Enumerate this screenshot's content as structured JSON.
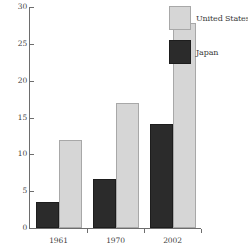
{
  "chart_data": {
    "type": "bar",
    "title": "",
    "subtitle": "",
    "xlabel": "",
    "ylabel": "",
    "categories": [
      "1961",
      "1970",
      "2002"
    ],
    "series": [
      {
        "name": "Japan",
        "color": "#2b2b2b",
        "values": [
          3.5,
          6.7,
          14.1
        ]
      },
      {
        "name": "United States",
        "color": "#d6d6d6",
        "values": [
          12.0,
          17.0,
          27.8
        ]
      }
    ],
    "ylim": [
      0,
      30
    ],
    "ytick_values": [
      0,
      5,
      10,
      15,
      20,
      25,
      30
    ],
    "ytick_labels": [
      "0",
      "5",
      "10",
      "15",
      "20",
      "25",
      "30"
    ],
    "grid": false,
    "legend_position": "top-right",
    "legend": [
      {
        "label": "United States",
        "color": "#d6d6d6"
      },
      {
        "label": "Japan",
        "color": "#2b2b2b"
      }
    ],
    "annotations": []
  }
}
